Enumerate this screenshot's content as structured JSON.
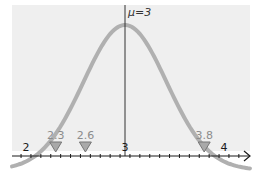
{
  "chart_data": {
    "type": "line",
    "title": "",
    "xlabel": "",
    "ylabel": "",
    "curve": "normal distribution density",
    "mean": 3,
    "mean_label": "μ=3",
    "xlim": [
      1.85,
      4.25
    ],
    "major_ticks": [
      2,
      3,
      4
    ],
    "major_tick_labels": [
      "2",
      "3",
      "4"
    ],
    "minor_tick_step": 0.1,
    "markers": [
      {
        "x": 2.3,
        "label": "2.3"
      },
      {
        "x": 2.6,
        "label": "2.6"
      },
      {
        "x": 3.8,
        "label": "3.8"
      }
    ],
    "colors": {
      "background": "#efefef",
      "curve": "#b0b0b0",
      "marker_fill": "#a9a9a9",
      "marker_label": "#8c8c8c",
      "axis": "#1a1a1a"
    }
  }
}
